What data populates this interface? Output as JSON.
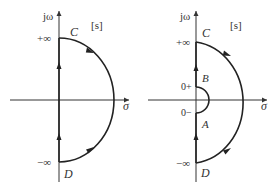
{
  "diagrams": [
    {
      "name": "nyquist-contour-basic",
      "plane_label": "[s]",
      "axis_labels": {
        "imag": "jω",
        "real": "σ"
      },
      "ticks": {
        "top": "+∞",
        "bottom": "−∞"
      },
      "points": {
        "top": "C",
        "bottom": "D"
      }
    },
    {
      "name": "nyquist-contour-indented",
      "plane_label": "[s]",
      "axis_labels": {
        "imag": "jω",
        "real": "σ"
      },
      "ticks": {
        "top": "+∞",
        "bottom": "−∞",
        "zero_plus": "0+",
        "zero_minus": "0−"
      },
      "points": {
        "top": "C",
        "bottom": "D",
        "indent_top": "B",
        "indent_bottom": "A"
      }
    }
  ],
  "colors": {
    "stroke": "#333333",
    "background": "#ffffff"
  }
}
